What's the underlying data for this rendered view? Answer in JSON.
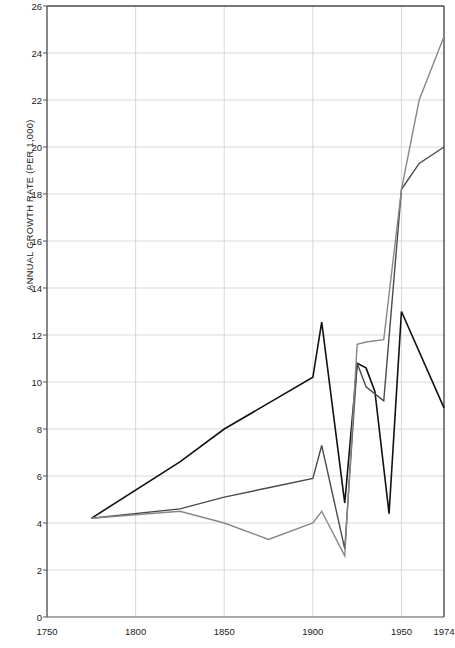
{
  "chart_data": {
    "type": "line",
    "title": "",
    "xlabel": "",
    "ylabel": "ANNUAL GROWTH RATE (PER 1,000)",
    "xlim": [
      1750,
      1974
    ],
    "ylim": [
      0,
      26
    ],
    "grid": true,
    "legend": "none",
    "xticks": [
      1750,
      1800,
      1850,
      1900,
      1950,
      1974
    ],
    "xtick_labels": [
      "1750",
      "1800",
      "1850",
      "1900",
      "1950",
      "1974"
    ],
    "yticks": [
      0,
      2,
      4,
      6,
      8,
      10,
      12,
      14,
      16,
      18,
      20,
      22,
      24,
      26
    ],
    "ytick_labels": [
      "0",
      "2",
      "4",
      "6",
      "8",
      "10",
      "12",
      "14",
      "16",
      "18",
      "20",
      "22",
      "24",
      "26"
    ],
    "series": [
      {
        "name": "series-dark",
        "color": "#111111",
        "width": 1.6,
        "x": [
          1775,
          1825,
          1850,
          1875,
          1900,
          1905,
          1918,
          1925,
          1930,
          1935,
          1943,
          1950,
          1974
        ],
        "values": [
          4.2,
          6.6,
          8.0,
          9.1,
          10.2,
          12.55,
          4.85,
          10.8,
          10.6,
          9.6,
          4.4,
          13.0,
          8.9
        ]
      },
      {
        "name": "series-medium",
        "color": "#4a4a4a",
        "width": 1.4,
        "x": [
          1775,
          1825,
          1850,
          1875,
          1900,
          1905,
          1918,
          1925,
          1930,
          1940,
          1950,
          1960,
          1974
        ],
        "values": [
          4.2,
          4.6,
          5.1,
          5.5,
          5.9,
          7.3,
          2.9,
          10.8,
          9.8,
          9.2,
          18.2,
          19.3,
          20.0
        ]
      },
      {
        "name": "series-light",
        "color": "#888888",
        "width": 1.4,
        "x": [
          1775,
          1825,
          1850,
          1875,
          1900,
          1905,
          1918,
          1925,
          1930,
          1940,
          1950,
          1960,
          1974
        ],
        "values": [
          4.2,
          4.5,
          4.0,
          3.3,
          4.0,
          4.5,
          2.6,
          11.6,
          11.7,
          11.8,
          18.2,
          22.0,
          24.7
        ]
      }
    ]
  }
}
